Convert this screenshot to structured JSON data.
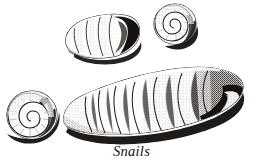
{
  "figure": {
    "caption": "Snails",
    "subject": "snails",
    "style": "stipple engraving",
    "background_color": "#ffffff",
    "ink_color": "#1a1613",
    "shadow_color": "#120f0d",
    "midtone_color": "#8d8781",
    "specimen_count": 4,
    "specimens": [
      {
        "id": "specimen-top-left",
        "name": "oval-whorled-shell",
        "label": "oval whorled shell, aperture right",
        "orientation": "horizontal",
        "whorl_count": 5
      },
      {
        "id": "specimen-top-right",
        "name": "planispiral-shell-small",
        "label": "flat coiled spiral shell, apical view",
        "orientation": "flat-coil",
        "whorl_count": 4
      },
      {
        "id": "specimen-bottom-left",
        "name": "planispiral-shell-large",
        "label": "flat coiled spiral shell, apical view",
        "orientation": "flat-coil",
        "whorl_count": 4
      },
      {
        "id": "specimen-center",
        "name": "elongate-conical-shell",
        "label": "elongate conical shell with segmented whorls, aperture right",
        "orientation": "horizontal",
        "whorl_count": 8
      }
    ]
  }
}
